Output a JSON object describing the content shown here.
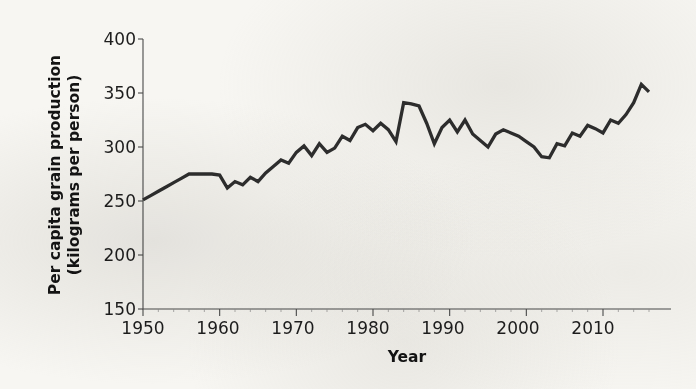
{
  "chart_data": {
    "type": "line",
    "title": "",
    "xlabel": "Year",
    "ylabel": "Per capita grain production (kilograms per person)",
    "ylabel_line1": "Per capita grain production",
    "ylabel_line2": "(kilograms per person)",
    "xlim": [
      1950,
      2016
    ],
    "ylim": [
      150,
      400
    ],
    "xticks": [
      1950,
      1960,
      1970,
      1980,
      1990,
      2000,
      2010
    ],
    "xtick_labels": [
      "1950",
      "1960",
      "1970",
      "1980",
      "1990",
      "2000",
      "2010"
    ],
    "yticks": [
      150,
      200,
      250,
      300,
      350,
      400
    ],
    "ytick_labels": [
      "150",
      "200",
      "250",
      "300",
      "350",
      "400"
    ],
    "grid": false,
    "legend": "none",
    "line_color": "#2e2e2e",
    "background_color": "#f7f6f2",
    "x": [
      1950,
      1951,
      1952,
      1953,
      1954,
      1955,
      1956,
      1957,
      1958,
      1959,
      1960,
      1961,
      1962,
      1963,
      1964,
      1965,
      1966,
      1967,
      1968,
      1969,
      1970,
      1971,
      1972,
      1973,
      1974,
      1975,
      1976,
      1977,
      1978,
      1979,
      1980,
      1981,
      1982,
      1983,
      1984,
      1985,
      1986,
      1987,
      1988,
      1989,
      1990,
      1991,
      1992,
      1993,
      1994,
      1995,
      1996,
      1997,
      1998,
      1999,
      2000,
      2001,
      2002,
      2003,
      2004,
      2005,
      2006,
      2007,
      2008,
      2009,
      2010,
      2011,
      2012,
      2013,
      2014,
      2015,
      2016
    ],
    "values": [
      251,
      255,
      259,
      263,
      267,
      271,
      275,
      275,
      275,
      275,
      274,
      262,
      268,
      265,
      272,
      268,
      276,
      282,
      288,
      285,
      295,
      301,
      292,
      303,
      295,
      299,
      310,
      306,
      318,
      321,
      315,
      322,
      316,
      305,
      341,
      340,
      338,
      322,
      303,
      318,
      325,
      314,
      325,
      312,
      306,
      300,
      312,
      316,
      313,
      310,
      305,
      300,
      291,
      290,
      303,
      301,
      313,
      310,
      320,
      317,
      313,
      325,
      322,
      330,
      341,
      358,
      351
    ],
    "series_name": "Per capita grain production"
  },
  "figure": {
    "axis_color": "#4b4b4b",
    "text_color": "#1d1d1d"
  }
}
